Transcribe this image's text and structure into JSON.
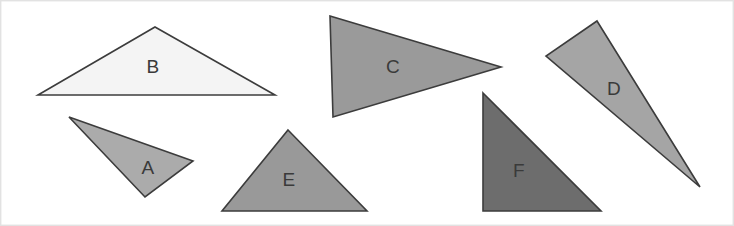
{
  "figure": {
    "canvas": {
      "width": 734,
      "height": 226,
      "background_color": "#ffffff",
      "border_color": "#e2e2e2"
    },
    "outline_color": "#3c3c3c",
    "outline_width": 1.6,
    "label_color": "#3a3a3a",
    "shapes": [
      {
        "id": "triangle-a",
        "label": "A",
        "fill_color": "#ababab",
        "points": "69,117 193,161 145,197",
        "label_x": 148,
        "label_y": 169
      },
      {
        "id": "triangle-b",
        "label": "B",
        "fill_color": "#f4f4f4",
        "points": "155,27 275,95 38,95",
        "label_x": 153,
        "label_y": 68
      },
      {
        "id": "triangle-c",
        "label": "C",
        "fill_color": "#9a9a9a",
        "points": "330,16 501,67 333,117",
        "label_x": 393,
        "label_y": 68
      },
      {
        "id": "triangle-d",
        "label": "D",
        "fill_color": "#a5a5a5",
        "points": "597,21 700,187 546,56",
        "label_x": 614,
        "label_y": 90
      },
      {
        "id": "triangle-e",
        "label": "E",
        "fill_color": "#999999",
        "points": "288,130 367,211 222,211",
        "label_x": 289,
        "label_y": 181
      },
      {
        "id": "triangle-f",
        "label": "F",
        "fill_color": "#6d6d6d",
        "points": "483,93 601,211 483,211",
        "label_x": 519,
        "label_y": 172
      }
    ]
  }
}
